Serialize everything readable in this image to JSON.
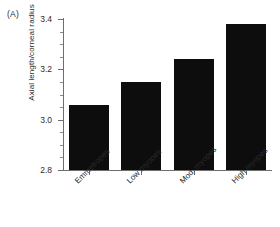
{
  "panel": {
    "label": "(A)"
  },
  "chart_data": {
    "type": "bar",
    "title": "",
    "subtitle": "",
    "xlabel": "",
    "ylabel": "Axial length/corneal radius",
    "categories": [
      "Emmetropes",
      "Low myopes",
      "Mod. myopes",
      "High myopes"
    ],
    "values": [
      3.06,
      3.15,
      3.24,
      3.38
    ],
    "ylim": [
      2.8,
      3.4
    ],
    "ytick_labels": [
      "3.4",
      "3.2",
      "3.0",
      "2.8"
    ],
    "ytick_values": [
      3.4,
      3.2,
      3.0,
      2.8
    ],
    "yminor_values": [
      3.35,
      3.3,
      3.25,
      3.15,
      3.1,
      3.05,
      2.95,
      2.9,
      2.85
    ],
    "grid": false,
    "legend": null,
    "bar_color": "#0d0d0d",
    "axis_color": "#6e6e6e"
  }
}
